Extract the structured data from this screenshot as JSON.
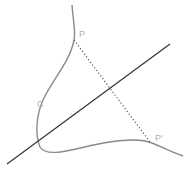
{
  "diagram": {
    "title": "",
    "labels": {
      "point": "P",
      "curve": "C",
      "reflected_point": "P'"
    },
    "colors": {
      "curve": "#8a8a8a",
      "axis_line": "#333333",
      "dotted_segment": "#555555",
      "label": "#b0b0b0",
      "background": "#ffffff"
    },
    "elements": [
      {
        "type": "curve",
        "name": "C"
      },
      {
        "type": "line",
        "name": "axis"
      },
      {
        "type": "dotted-segment",
        "from": "P",
        "to": "P'"
      },
      {
        "type": "point",
        "name": "P"
      },
      {
        "type": "point",
        "name": "P'"
      }
    ]
  }
}
